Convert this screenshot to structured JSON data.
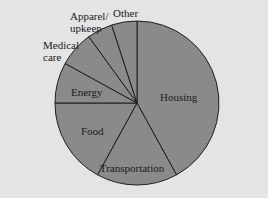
{
  "chart_data": {
    "type": "pie",
    "title": "",
    "categories": [
      "Housing",
      "Transportation",
      "Food",
      "Energy",
      "Medical care",
      "Apparel/upkeep",
      "Other"
    ],
    "values": [
      42,
      16,
      17,
      8,
      7,
      5,
      5
    ],
    "unit": "percent (estimated from slice angles)",
    "start_angle_deg": 90,
    "direction": "clockwise from top: Housing first",
    "labels_inside": [
      "Housing",
      "Transportation",
      "Food",
      "Energy"
    ],
    "labels_outside": [
      "Medical care",
      "Apparel/upkeep",
      "Other"
    ],
    "legend": "none",
    "colors": {
      "slice_fill": "#8a8a8a",
      "slice_stroke": "#1e1e1e",
      "background": "#e4e4e4"
    }
  },
  "labels": {
    "housing": "Housing",
    "transportation": "Transportation",
    "food": "Food",
    "energy": "Energy",
    "medical_line1": "Medical",
    "medical_line2": "care",
    "apparel_line1": "Apparel/",
    "apparel_line2": "upkeep",
    "other": "Other"
  },
  "cut_off_text": "..."
}
